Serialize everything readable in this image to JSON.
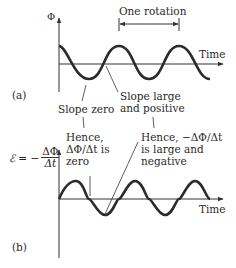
{
  "panel_a": {
    "label": "(a)",
    "y_axis_label": "Φ",
    "x_axis_label": "Time",
    "period_label": "One rotation",
    "annotation_left": "Slope zero",
    "annotation_right_line1": "Slope large",
    "annotation_right_line2": "and positive"
  },
  "panel_b": {
    "label": "(b)",
    "y_axis_label_prefix": "ℰ = −",
    "y_axis_label_num": "ΔΦ",
    "y_axis_label_den": "Δt",
    "x_axis_label": "Time",
    "annotation_left_line1": "Hence,",
    "annotation_left_line2": "ΔΦ/Δt is",
    "annotation_left_line3": "zero",
    "annotation_right_line1": "Hence, −ΔΦ/Δt",
    "annotation_right_line2": "is large and",
    "annotation_right_line3": "negative"
  },
  "colors": {
    "curve": "#2b2b2b",
    "axis": "#333333",
    "text": "#2a2a2a"
  }
}
